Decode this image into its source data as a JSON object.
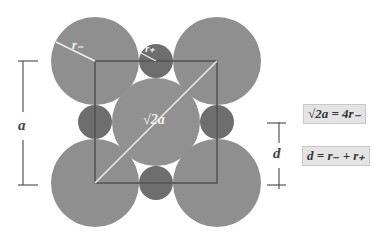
{
  "diagram": {
    "labels": {
      "r_minus": "r₋",
      "r_plus": "r₊",
      "diag": "√2a",
      "a": "a",
      "d": "d"
    },
    "equations": {
      "eq1": "√2a = 4r₋",
      "eq2": "d = r₋ + r₊"
    },
    "colors": {
      "large_ion": "#8f8f8f",
      "small_ion": "#6e6e6e",
      "square": "#555555",
      "radius_line": "#eeeeee",
      "box_bg": "#e4e4e4"
    }
  }
}
